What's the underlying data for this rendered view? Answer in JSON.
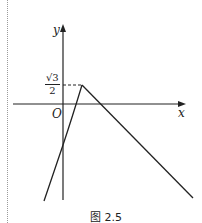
{
  "figure": {
    "caption": "图 2.5",
    "axes": {
      "x_label": "x",
      "y_label": "y",
      "origin_label": "O"
    },
    "peak_label": {
      "numerator": "√3",
      "denominator": "2"
    },
    "colors": {
      "line": "#222222",
      "background": "#ffffff"
    }
  }
}
